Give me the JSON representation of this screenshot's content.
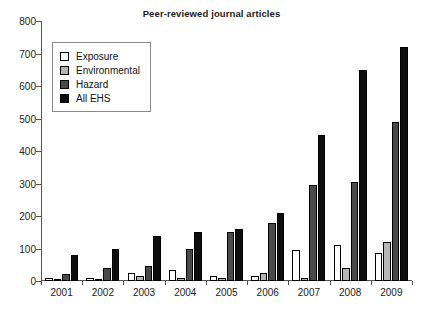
{
  "chart_data": {
    "type": "bar",
    "title": "Peer-reviewed journal articles",
    "xlabel": "",
    "ylabel": "",
    "categories": [
      "2001",
      "2002",
      "2003",
      "2004",
      "2005",
      "2006",
      "2007",
      "2008",
      "2009"
    ],
    "series": [
      {
        "name": "Exposure",
        "color": "#ffffff",
        "values": [
          10,
          8,
          25,
          35,
          15,
          15,
          95,
          110,
          85
        ]
      },
      {
        "name": "Environmental",
        "color": "#b5b5b5",
        "values": [
          3,
          5,
          15,
          10,
          10,
          25,
          8,
          40,
          120
        ]
      },
      {
        "name": "Hazard",
        "color": "#4a4a4a",
        "values": [
          22,
          40,
          45,
          100,
          150,
          180,
          295,
          305,
          490
        ]
      },
      {
        "name": "All EHS",
        "color": "#0d0d0d",
        "values": [
          80,
          100,
          140,
          150,
          160,
          210,
          450,
          650,
          720
        ]
      }
    ],
    "ylim": [
      0,
      800
    ],
    "yticks": [
      0,
      100,
      200,
      300,
      400,
      500,
      600,
      700,
      800
    ],
    "ytick_labels": [
      "0",
      "100",
      "200",
      "300",
      "400",
      "500",
      "600",
      "700",
      "800"
    ],
    "grid": false,
    "legend_position": "top-left"
  },
  "legend": {
    "items": [
      {
        "label": "Exposure"
      },
      {
        "label": "Environmental"
      },
      {
        "label": "Hazard"
      },
      {
        "label": "All EHS"
      }
    ]
  }
}
